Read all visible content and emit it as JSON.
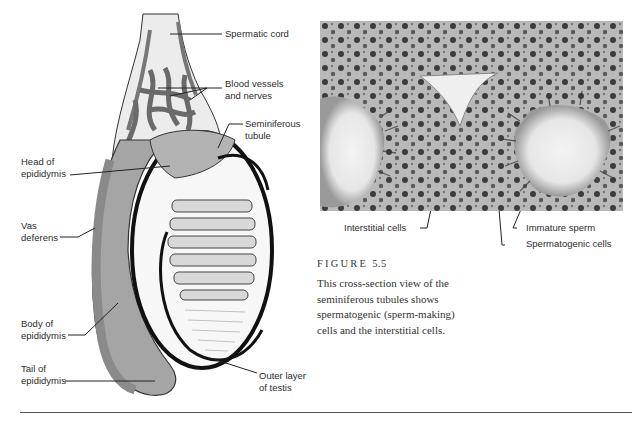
{
  "diagram": {
    "labels": {
      "spermatic_cord": "Spermatic cord",
      "blood_vessels_1": "Blood vessels",
      "blood_vessels_2": "and nerves",
      "seminiferous_1": "Seminiferous",
      "seminiferous_2": "tubule",
      "head_1": "Head of",
      "head_2": "epididymis",
      "vas_1": "Vas",
      "vas_2": "deferens",
      "body_1": "Body of",
      "body_2": "epididymis",
      "tail_1": "Tail of",
      "tail_2": "epididymis",
      "outer_1": "Outer layer",
      "outer_2": "of testis"
    },
    "colors": {
      "tubule_fill": "#9a9a9a",
      "outline": "#1a1a1a",
      "background": "#ffffff",
      "cord_fill": "#e8e8e8"
    }
  },
  "photo": {
    "description": "Micrograph cross-section of seminiferous tubules",
    "labels": {
      "interstitial": "Interstitial cells",
      "immature": "Immature sperm",
      "spermatogenic": "Spermatogenic cells"
    }
  },
  "figure": {
    "label": "FIGURE",
    "number": "5.5",
    "caption": "This cross-section view of the seminiferous tubules shows spermatogenic (sperm-making) cells and the interstitial cells."
  }
}
